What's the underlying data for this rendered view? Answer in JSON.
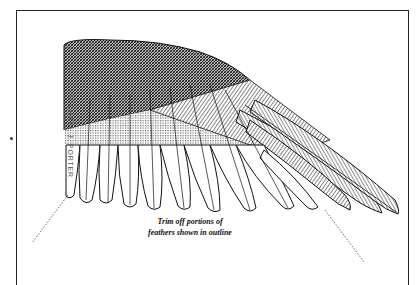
{
  "illustration": {
    "subject": "bird wing feather trimming diagram",
    "caption_line1": "Trim off portions of",
    "caption_line2": "feathers shown in outline",
    "signature": "MICHAEL J. PORTER",
    "colors": {
      "ink": "#111111",
      "paper": "#ffffff",
      "frame": "#222222"
    }
  }
}
